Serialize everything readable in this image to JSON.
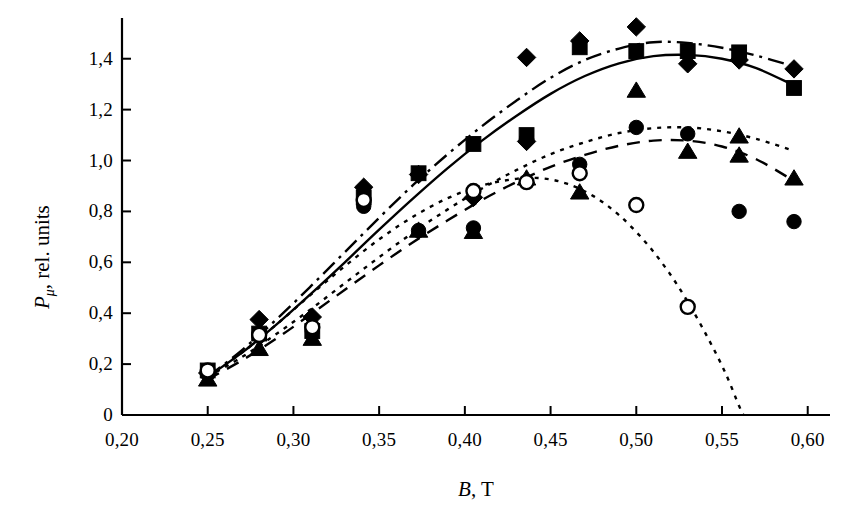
{
  "chart_data": {
    "type": "scatter",
    "title": "",
    "xlabel": "B, T",
    "ylabel": "P_μ, rel. units",
    "ylabel_main": "P",
    "ylabel_sub": "μ",
    "ylabel_rest": ", rel. units",
    "xlabel_main": "B",
    "xlabel_rest": ", T",
    "decimal_separator": ",",
    "grid": false,
    "legend": "none",
    "xlim": [
      0.2,
      0.613
    ],
    "ylim": [
      0.0,
      1.56
    ],
    "xticks": [
      0.2,
      0.25,
      0.3,
      0.35,
      0.4,
      0.45,
      0.5,
      0.55,
      0.6
    ],
    "xtick_labels": [
      "0,20",
      "0,25",
      "0,30",
      "0,35",
      "0,40",
      "0,45",
      "0,50",
      "0,55",
      "0,60"
    ],
    "yticks": [
      0,
      0.2,
      0.4,
      0.6,
      0.8,
      1.0,
      1.2,
      1.4
    ],
    "ytick_labels": [
      "0",
      "0,2",
      "0,4",
      "0,6",
      "0,8",
      "1,0",
      "1,2",
      "1,4"
    ],
    "axis_color": "#000000",
    "series": [
      {
        "name": "filled-diamond",
        "marker": "diamond",
        "filled": true,
        "line_style": "dashdot",
        "points": [
          {
            "x": 0.25,
            "y": 0.165
          },
          {
            "x": 0.28,
            "y": 0.375
          },
          {
            "x": 0.311,
            "y": 0.385
          },
          {
            "x": 0.341,
            "y": 0.895
          },
          {
            "x": 0.373,
            "y": 0.945
          },
          {
            "x": 0.405,
            "y": 0.855
          },
          {
            "x": 0.436,
            "y": 1.405
          },
          {
            "x": 0.436,
            "y": 1.075
          },
          {
            "x": 0.467,
            "y": 1.47
          },
          {
            "x": 0.5,
            "y": 1.525
          },
          {
            "x": 0.53,
            "y": 1.38
          },
          {
            "x": 0.56,
            "y": 1.395
          },
          {
            "x": 0.592,
            "y": 1.36
          }
        ],
        "curve": [
          {
            "x": 0.25,
            "y": 0.15
          },
          {
            "x": 0.27,
            "y": 0.255
          },
          {
            "x": 0.29,
            "y": 0.375
          },
          {
            "x": 0.31,
            "y": 0.505
          },
          {
            "x": 0.33,
            "y": 0.64
          },
          {
            "x": 0.35,
            "y": 0.775
          },
          {
            "x": 0.37,
            "y": 0.905
          },
          {
            "x": 0.39,
            "y": 1.025
          },
          {
            "x": 0.41,
            "y": 1.135
          },
          {
            "x": 0.43,
            "y": 1.235
          },
          {
            "x": 0.45,
            "y": 1.325
          },
          {
            "x": 0.47,
            "y": 1.395
          },
          {
            "x": 0.49,
            "y": 1.44
          },
          {
            "x": 0.51,
            "y": 1.465
          },
          {
            "x": 0.53,
            "y": 1.462
          },
          {
            "x": 0.55,
            "y": 1.443
          },
          {
            "x": 0.57,
            "y": 1.412
          },
          {
            "x": 0.592,
            "y": 1.37
          }
        ]
      },
      {
        "name": "filled-square",
        "marker": "square",
        "filled": true,
        "line_style": "solid",
        "points": [
          {
            "x": 0.25,
            "y": 0.175
          },
          {
            "x": 0.28,
            "y": 0.32
          },
          {
            "x": 0.311,
            "y": 0.33
          },
          {
            "x": 0.341,
            "y": 0.855
          },
          {
            "x": 0.373,
            "y": 0.95
          },
          {
            "x": 0.405,
            "y": 1.065
          },
          {
            "x": 0.436,
            "y": 1.1
          },
          {
            "x": 0.467,
            "y": 1.445
          },
          {
            "x": 0.5,
            "y": 1.43
          },
          {
            "x": 0.53,
            "y": 1.43
          },
          {
            "x": 0.56,
            "y": 1.425
          },
          {
            "x": 0.592,
            "y": 1.285
          }
        ],
        "curve": [
          {
            "x": 0.25,
            "y": 0.15
          },
          {
            "x": 0.27,
            "y": 0.245
          },
          {
            "x": 0.29,
            "y": 0.355
          },
          {
            "x": 0.31,
            "y": 0.475
          },
          {
            "x": 0.33,
            "y": 0.6
          },
          {
            "x": 0.35,
            "y": 0.728
          },
          {
            "x": 0.37,
            "y": 0.852
          },
          {
            "x": 0.39,
            "y": 0.97
          },
          {
            "x": 0.41,
            "y": 1.078
          },
          {
            "x": 0.43,
            "y": 1.175
          },
          {
            "x": 0.45,
            "y": 1.262
          },
          {
            "x": 0.47,
            "y": 1.332
          },
          {
            "x": 0.49,
            "y": 1.382
          },
          {
            "x": 0.51,
            "y": 1.41
          },
          {
            "x": 0.53,
            "y": 1.415
          },
          {
            "x": 0.55,
            "y": 1.4
          },
          {
            "x": 0.57,
            "y": 1.363
          },
          {
            "x": 0.592,
            "y": 1.295
          }
        ]
      },
      {
        "name": "filled-circle",
        "marker": "circle",
        "filled": true,
        "line_style": "dotted",
        "points": [
          {
            "x": 0.25,
            "y": 0.16
          },
          {
            "x": 0.28,
            "y": 0.31
          },
          {
            "x": 0.311,
            "y": 0.33
          },
          {
            "x": 0.341,
            "y": 0.82
          },
          {
            "x": 0.373,
            "y": 0.725
          },
          {
            "x": 0.405,
            "y": 0.735
          },
          {
            "x": 0.436,
            "y": 1.085
          },
          {
            "x": 0.467,
            "y": 0.985
          },
          {
            "x": 0.5,
            "y": 1.13
          },
          {
            "x": 0.53,
            "y": 1.105
          },
          {
            "x": 0.56,
            "y": 0.8
          },
          {
            "x": 0.592,
            "y": 0.76
          }
        ],
        "curve": [
          {
            "x": 0.25,
            "y": 0.15
          },
          {
            "x": 0.27,
            "y": 0.228
          },
          {
            "x": 0.29,
            "y": 0.318
          },
          {
            "x": 0.31,
            "y": 0.415
          },
          {
            "x": 0.33,
            "y": 0.518
          },
          {
            "x": 0.35,
            "y": 0.62
          },
          {
            "x": 0.37,
            "y": 0.718
          },
          {
            "x": 0.39,
            "y": 0.808
          },
          {
            "x": 0.41,
            "y": 0.89
          },
          {
            "x": 0.43,
            "y": 0.962
          },
          {
            "x": 0.45,
            "y": 1.025
          },
          {
            "x": 0.47,
            "y": 1.072
          },
          {
            "x": 0.49,
            "y": 1.108
          },
          {
            "x": 0.51,
            "y": 1.127
          },
          {
            "x": 0.53,
            "y": 1.13
          },
          {
            "x": 0.55,
            "y": 1.115
          },
          {
            "x": 0.57,
            "y": 1.085
          },
          {
            "x": 0.592,
            "y": 1.038
          }
        ]
      },
      {
        "name": "filled-triangle",
        "marker": "triangle",
        "filled": true,
        "line_style": "dashed",
        "points": [
          {
            "x": 0.25,
            "y": 0.14
          },
          {
            "x": 0.28,
            "y": 0.26
          },
          {
            "x": 0.311,
            "y": 0.3
          },
          {
            "x": 0.373,
            "y": 0.725
          },
          {
            "x": 0.405,
            "y": 0.72
          },
          {
            "x": 0.436,
            "y": 0.93
          },
          {
            "x": 0.467,
            "y": 0.875
          },
          {
            "x": 0.5,
            "y": 1.275
          },
          {
            "x": 0.53,
            "y": 1.035
          },
          {
            "x": 0.56,
            "y": 1.095
          },
          {
            "x": 0.56,
            "y": 1.02
          },
          {
            "x": 0.592,
            "y": 0.93
          }
        ],
        "curve": [
          {
            "x": 0.25,
            "y": 0.14
          },
          {
            "x": 0.27,
            "y": 0.215
          },
          {
            "x": 0.29,
            "y": 0.3
          },
          {
            "x": 0.31,
            "y": 0.395
          },
          {
            "x": 0.33,
            "y": 0.492
          },
          {
            "x": 0.35,
            "y": 0.588
          },
          {
            "x": 0.37,
            "y": 0.68
          },
          {
            "x": 0.39,
            "y": 0.765
          },
          {
            "x": 0.41,
            "y": 0.845
          },
          {
            "x": 0.43,
            "y": 0.915
          },
          {
            "x": 0.45,
            "y": 0.975
          },
          {
            "x": 0.47,
            "y": 1.022
          },
          {
            "x": 0.49,
            "y": 1.058
          },
          {
            "x": 0.51,
            "y": 1.078
          },
          {
            "x": 0.53,
            "y": 1.078
          },
          {
            "x": 0.55,
            "y": 1.055
          },
          {
            "x": 0.57,
            "y": 1.005
          },
          {
            "x": 0.592,
            "y": 0.92
          }
        ]
      },
      {
        "name": "open-circle",
        "marker": "circle",
        "filled": false,
        "line_style": "dotted",
        "points": [
          {
            "x": 0.25,
            "y": 0.175
          },
          {
            "x": 0.28,
            "y": 0.315
          },
          {
            "x": 0.311,
            "y": 0.345
          },
          {
            "x": 0.341,
            "y": 0.845
          },
          {
            "x": 0.405,
            "y": 0.88
          },
          {
            "x": 0.436,
            "y": 0.915
          },
          {
            "x": 0.467,
            "y": 0.95
          },
          {
            "x": 0.5,
            "y": 0.825
          },
          {
            "x": 0.53,
            "y": 0.425
          }
        ],
        "curve": [
          {
            "x": 0.25,
            "y": 0.15
          },
          {
            "x": 0.27,
            "y": 0.245
          },
          {
            "x": 0.29,
            "y": 0.355
          },
          {
            "x": 0.31,
            "y": 0.472
          },
          {
            "x": 0.33,
            "y": 0.585
          },
          {
            "x": 0.35,
            "y": 0.69
          },
          {
            "x": 0.37,
            "y": 0.78
          },
          {
            "x": 0.39,
            "y": 0.852
          },
          {
            "x": 0.41,
            "y": 0.902
          },
          {
            "x": 0.43,
            "y": 0.928
          },
          {
            "x": 0.445,
            "y": 0.93
          },
          {
            "x": 0.46,
            "y": 0.908
          },
          {
            "x": 0.475,
            "y": 0.86
          },
          {
            "x": 0.49,
            "y": 0.785
          },
          {
            "x": 0.505,
            "y": 0.682
          },
          {
            "x": 0.518,
            "y": 0.57
          },
          {
            "x": 0.53,
            "y": 0.445
          },
          {
            "x": 0.542,
            "y": 0.3
          },
          {
            "x": 0.552,
            "y": 0.165
          },
          {
            "x": 0.56,
            "y": 0.035
          },
          {
            "x": 0.5625,
            "y": 0.0
          }
        ]
      }
    ]
  }
}
